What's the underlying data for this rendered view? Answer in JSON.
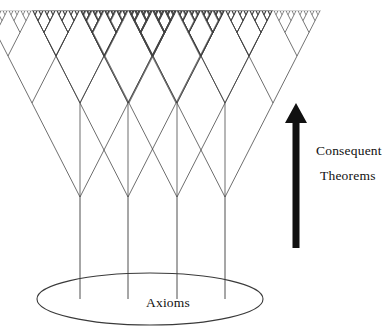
{
  "figure": {
    "background_color": "#ffffff",
    "line_color": "#3a3a3a",
    "arrow_color": "#111111",
    "text_color": "#111111",
    "width": 387,
    "height": 332
  },
  "labels": {
    "consequent": "Consequent",
    "theorems": "Theorems",
    "axioms": "Axioms"
  },
  "arrow": {
    "name": "upward-direction-arrow",
    "direction": "up",
    "tip_x": 296,
    "tip_y": 103,
    "tail_y": 248,
    "shaft_half_width": 3.5,
    "head_half_width": 11,
    "head_height": 20
  },
  "ellipse": {
    "name": "axioms-base-ellipse",
    "cx": 150,
    "cy": 299,
    "rx": 113,
    "ry": 26
  },
  "tree": {
    "description": "Binary branching tree growing upward from 4 axiom roots; each node splits into 2 children per level, producing an increasingly dense canopy of consequent theorems.",
    "root_count": 4,
    "root_xs": [
      80,
      128,
      177,
      225
    ],
    "root_base_y": 299,
    "node_y": 197,
    "levels": 7,
    "branch_spread_first": 48,
    "level_heights": [
      94,
      47,
      23.5,
      11.75,
      5.9,
      3.0,
      1.5
    ],
    "canopy_top_y": 13,
    "canopy_left_x": 13,
    "canopy_right_x": 291,
    "stem_bottom_y": 299
  },
  "chart_data": {
    "type": "diagram",
    "annotations": [
      "Consequent",
      "Theorems",
      "Axioms"
    ]
  }
}
